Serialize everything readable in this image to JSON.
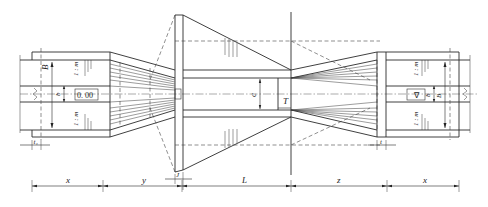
{
  "diagram": {
    "type": "engineering plan view",
    "dimension_labels": {
      "x_left": "x",
      "y": "y",
      "L": "L",
      "z": "z",
      "x_right": "x",
      "J": "J",
      "t1": "t₁",
      "t": "t",
      "T": "T",
      "c": "c"
    },
    "left_section": {
      "width_label": "B",
      "depth_label": "b",
      "elevation_mark": "0. 00",
      "slope_top": "1 : m",
      "slope_bottom": "1 : m"
    },
    "right_section": {
      "width_label": "B",
      "depth_label": "b",
      "elevation_mark": "∇",
      "slope_top": "1 : m",
      "slope_bottom": "1 : m"
    },
    "break_marks": [
      "left-break",
      "right-break"
    ]
  }
}
